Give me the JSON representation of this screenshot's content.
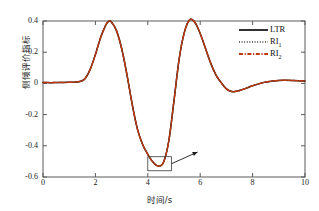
{
  "chart_data": {
    "type": "line",
    "title": "",
    "xlabel": "时间/s",
    "ylabel": "侧倾评价指标",
    "xlim": [
      0,
      10
    ],
    "ylim": [
      -0.6,
      0.4
    ],
    "xticks": [
      "0",
      "2",
      "4",
      "6",
      "8",
      "10"
    ],
    "xtick_values": [
      0,
      2,
      4,
      6,
      8,
      10
    ],
    "yticks": [
      "0.4",
      "0.2",
      "0",
      "-0.2",
      "-0.4",
      "-0.6"
    ],
    "ytick_values": [
      0.4,
      0.2,
      0,
      -0.2,
      -0.4,
      -0.6
    ],
    "grid": false,
    "legend_position": "top-right",
    "x": [
      0,
      0.2,
      0.4,
      0.6,
      0.8,
      1.0,
      1.2,
      1.4,
      1.6,
      1.8,
      2.0,
      2.2,
      2.4,
      2.5,
      2.6,
      2.8,
      3.0,
      3.2,
      3.4,
      3.6,
      3.8,
      4.0,
      4.2,
      4.4,
      4.6,
      4.8,
      5.0,
      5.2,
      5.4,
      5.6,
      5.8,
      6.0,
      6.2,
      6.4,
      6.6,
      6.8,
      7.0,
      7.2,
      7.4,
      7.6,
      7.8,
      8.0,
      8.4,
      8.8,
      9.2,
      9.6,
      10.0
    ],
    "series": [
      {
        "name": "LTR",
        "style": "solid",
        "color": "#1a1a1a",
        "values": [
          0.005,
          0.005,
          0.005,
          0.006,
          0.006,
          0.007,
          0.008,
          0.012,
          0.03,
          0.09,
          0.185,
          0.295,
          0.375,
          0.398,
          0.395,
          0.34,
          0.225,
          0.06,
          -0.13,
          -0.29,
          -0.39,
          -0.455,
          -0.505,
          -0.53,
          -0.505,
          -0.37,
          -0.11,
          0.16,
          0.33,
          0.408,
          0.39,
          0.32,
          0.225,
          0.13,
          0.055,
          0.005,
          -0.035,
          -0.052,
          -0.05,
          -0.04,
          -0.028,
          -0.015,
          0.005,
          0.016,
          0.02,
          0.018,
          0.015
        ]
      },
      {
        "name": "RI₁",
        "style": "dotted",
        "color": "#2a2a2a",
        "values": [
          0.005,
          0.005,
          0.005,
          0.006,
          0.006,
          0.007,
          0.008,
          0.012,
          0.03,
          0.09,
          0.185,
          0.295,
          0.375,
          0.398,
          0.395,
          0.34,
          0.225,
          0.06,
          -0.13,
          -0.29,
          -0.39,
          -0.455,
          -0.505,
          -0.53,
          -0.505,
          -0.37,
          -0.11,
          0.16,
          0.33,
          0.408,
          0.39,
          0.32,
          0.225,
          0.13,
          0.055,
          0.005,
          -0.035,
          -0.052,
          -0.05,
          -0.04,
          -0.028,
          -0.015,
          0.005,
          0.016,
          0.02,
          0.018,
          0.015
        ]
      },
      {
        "name": "RI₂",
        "style": "dashdot",
        "color": "#c0390f",
        "values": [
          0.005,
          0.005,
          0.005,
          0.006,
          0.006,
          0.007,
          0.008,
          0.012,
          0.03,
          0.09,
          0.185,
          0.295,
          0.375,
          0.398,
          0.395,
          0.34,
          0.225,
          0.06,
          -0.13,
          -0.29,
          -0.39,
          -0.455,
          -0.505,
          -0.53,
          -0.505,
          -0.37,
          -0.11,
          0.16,
          0.33,
          0.408,
          0.39,
          0.32,
          0.225,
          0.13,
          0.055,
          0.005,
          -0.035,
          -0.052,
          -0.05,
          -0.04,
          -0.028,
          -0.015,
          0.005,
          0.016,
          0.02,
          0.018,
          0.015
        ]
      }
    ],
    "annotations": [
      {
        "type": "zoom-box",
        "name": "trough-highlight-box",
        "x_range": [
          4.0,
          4.9
        ],
        "y_range": [
          -0.56,
          -0.47
        ]
      },
      {
        "type": "arrow",
        "name": "zoom-callout-arrow",
        "from": [
          4.9,
          -0.515
        ],
        "to": [
          5.9,
          -0.44
        ]
      }
    ]
  },
  "legend": {
    "items": [
      {
        "label": "LTR",
        "sub": "",
        "style": "solid",
        "color": "#1a1a1a"
      },
      {
        "label": "RI",
        "sub": "1",
        "style": "dotted",
        "color": "#2a2a2a"
      },
      {
        "label": "RI",
        "sub": "2",
        "style": "dashdot",
        "color": "#c0390f"
      }
    ]
  },
  "axes": {
    "x_label": "时间/s",
    "y_label": "侧倾评价指标",
    "x_ticks": [
      "0",
      "2",
      "4",
      "6",
      "8",
      "10"
    ],
    "y_ticks": [
      "0.4",
      "0.2",
      "0",
      "-0.2",
      "-0.4",
      "-0.6"
    ]
  },
  "colors": {
    "ltr": "#1a1a1a",
    "ri1": "#2a2a2a",
    "ri2": "#c0390f",
    "axis": "#4a4a4a",
    "background": "#ffffff"
  }
}
